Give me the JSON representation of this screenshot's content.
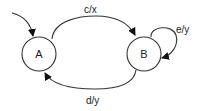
{
  "diagram": {
    "type": "state-machine",
    "states": [
      {
        "id": "A",
        "label": "A",
        "initial": true
      },
      {
        "id": "B",
        "label": "B",
        "initial": false
      }
    ],
    "transitions": [
      {
        "from": "A",
        "to": "B",
        "label": "c/x"
      },
      {
        "from": "B",
        "to": "B",
        "label": "e/y"
      },
      {
        "from": "B",
        "to": "A",
        "label": "d/y"
      }
    ]
  },
  "colors": {
    "stroke": "#333333",
    "arrowhead": "#111111",
    "background": "#ffffff"
  }
}
